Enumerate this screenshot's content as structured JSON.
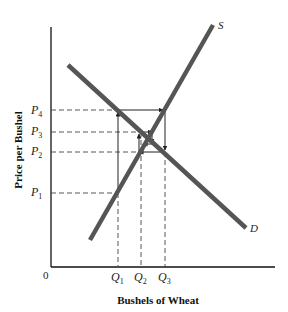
{
  "diagram": {
    "y_axis_title": "Price per Bushel",
    "x_axis_title": "Bushels of Wheat",
    "origin_label": "0",
    "supply_label": "S",
    "demand_label": "D",
    "price_labels": [
      {
        "base": "P",
        "sub": "4"
      },
      {
        "base": "P",
        "sub": "3"
      },
      {
        "base": "P",
        "sub": "2"
      },
      {
        "base": "P",
        "sub": "1"
      }
    ],
    "quantity_labels": [
      {
        "base": "Q",
        "sub": "1"
      },
      {
        "base": "Q",
        "sub": "2"
      },
      {
        "base": "Q",
        "sub": "3"
      }
    ],
    "line_color": "#555555",
    "axis_color": "#111111"
  }
}
